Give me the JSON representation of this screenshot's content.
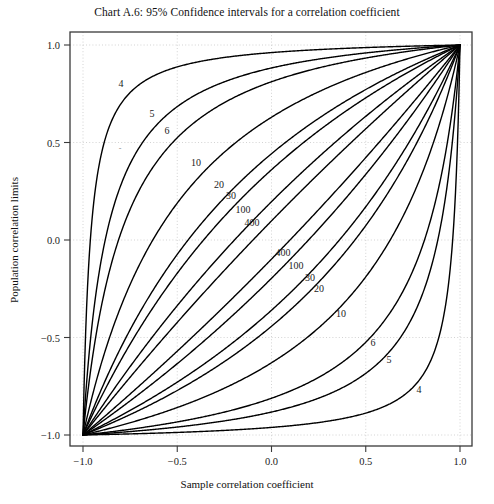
{
  "chart_data": {
    "type": "line",
    "title": "Chart A.6: 95% Confidence intervals for a correlation coefficient",
    "xlabel": "Sample correlation coefficient",
    "ylabel": "Population correlation limits",
    "xlim": [
      -1.0,
      1.0
    ],
    "ylim": [
      -1.0,
      1.0
    ],
    "xticks": [
      -1.0,
      -0.5,
      0.0,
      0.5,
      1.0
    ],
    "yticks": [
      -1.0,
      -0.5,
      0.0,
      0.5,
      1.0
    ],
    "xticklabels": [
      "−1.0",
      "−0.5",
      "0.0",
      "0.5",
      "1.0"
    ],
    "yticklabels": [
      "−1.0",
      "−0.5",
      "0.0",
      "0.5",
      "1.0"
    ],
    "grid": true,
    "grid_style": "dotted",
    "grid_color": "#c8c8c8",
    "legend": "none",
    "line_color": "#000000",
    "line_width": 1.4,
    "confidence_level": "95%",
    "sample_sizes": [
      4,
      5,
      6,
      10,
      20,
      30,
      100,
      400
    ],
    "series": [
      {
        "name": "n=4 upper",
        "n": 4,
        "bound": "upper"
      },
      {
        "name": "n=4 lower",
        "n": 4,
        "bound": "lower"
      },
      {
        "name": "n=5 upper",
        "n": 5,
        "bound": "upper"
      },
      {
        "name": "n=5 lower",
        "n": 5,
        "bound": "lower"
      },
      {
        "name": "n=6 upper",
        "n": 6,
        "bound": "upper"
      },
      {
        "name": "n=6 lower",
        "n": 6,
        "bound": "lower"
      },
      {
        "name": "n=10 upper",
        "n": 10,
        "bound": "upper"
      },
      {
        "name": "n=10 lower",
        "n": 10,
        "bound": "lower"
      },
      {
        "name": "n=20 upper",
        "n": 20,
        "bound": "upper"
      },
      {
        "name": "n=20 lower",
        "n": 20,
        "bound": "lower"
      },
      {
        "name": "n=30 upper",
        "n": 30,
        "bound": "upper"
      },
      {
        "name": "n=30 lower",
        "n": 30,
        "bound": "lower"
      },
      {
        "name": "n=100 upper",
        "n": 100,
        "bound": "upper"
      },
      {
        "name": "n=100 lower",
        "n": 100,
        "bound": "lower"
      },
      {
        "name": "n=400 upper",
        "n": 400,
        "bound": "upper"
      },
      {
        "name": "n=400 lower",
        "n": 400,
        "bound": "lower"
      }
    ],
    "curve_labels": [
      {
        "text": "4",
        "x": 121,
        "y": 83
      },
      {
        "text": "5",
        "x": 152,
        "y": 113
      },
      {
        "text": "6",
        "x": 167,
        "y": 130
      },
      {
        "text": "10",
        "x": 196,
        "y": 162
      },
      {
        "text": "20",
        "x": 219,
        "y": 184
      },
      {
        "text": "30",
        "x": 231,
        "y": 195
      },
      {
        "text": "100",
        "x": 243,
        "y": 209
      },
      {
        "text": "400",
        "x": 252,
        "y": 222
      },
      {
        "text": "400",
        "x": 283,
        "y": 252
      },
      {
        "text": "100",
        "x": 296,
        "y": 265
      },
      {
        "text": "30",
        "x": 310,
        "y": 277
      },
      {
        "text": "20",
        "x": 319,
        "y": 288
      },
      {
        "text": "10",
        "x": 341,
        "y": 313
      },
      {
        "text": "6",
        "x": 373,
        "y": 342
      },
      {
        "text": "5",
        "x": 389,
        "y": 359
      },
      {
        "text": "4",
        "x": 419,
        "y": 389
      }
    ],
    "faint_mark": "-"
  },
  "plot_area": {
    "left": 70,
    "top": 32,
    "right": 472,
    "bottom": 446
  }
}
